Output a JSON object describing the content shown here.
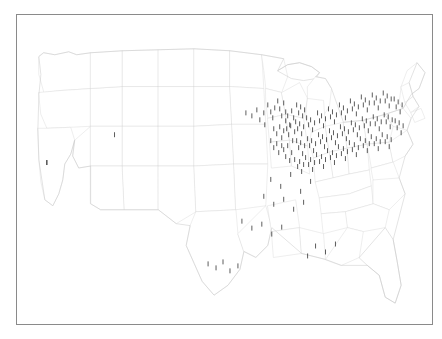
{
  "figure": {
    "type": "point-map",
    "title": "",
    "background_color": "#ffffff",
    "frame": {
      "visible": true,
      "color": "#8a8a8a",
      "x": 16,
      "y": 14,
      "width": 417,
      "height": 311
    },
    "basemap": {
      "region": "United States (contiguous)",
      "boundary_color": "#d9d9d9",
      "coast_color": "#c9c9c9",
      "fill_color": "#ffffff",
      "projection_hint": "albers-usa-like"
    },
    "marker_style": {
      "shape": "vertical-tick",
      "color": "#2a2a2a",
      "width_px": 1,
      "height_px": 5,
      "opacity": 0.85
    },
    "axes": {
      "x_axis_visible": false,
      "y_axis_visible": false,
      "tick_labels": [],
      "gridlines": false
    },
    "legend": {
      "visible": false,
      "entries": []
    },
    "annotations": []
  },
  "chart_data": {
    "type": "scatter",
    "title": "",
    "subtitle": "",
    "xlabel": "",
    "ylabel": "",
    "grid": false,
    "legend_position": "none",
    "xlim": [
      0,
      417
    ],
    "ylim": [
      0,
      311
    ],
    "series": [
      {
        "name": "locations",
        "marker": "vertical-tick",
        "color": "#2a2a2a",
        "count": 184,
        "points": [
          [
            30,
            146
          ],
          [
            30,
            146
          ],
          [
            98,
            118
          ],
          [
            230,
            96
          ],
          [
            236,
            99
          ],
          [
            241,
            93
          ],
          [
            244,
            103
          ],
          [
            248,
            96
          ],
          [
            252,
            88
          ],
          [
            255,
            95
          ],
          [
            257,
            101
          ],
          [
            259,
            91
          ],
          [
            249,
            108
          ],
          [
            262,
            84
          ],
          [
            264,
            92
          ],
          [
            266,
            99
          ],
          [
            268,
            86
          ],
          [
            270,
            95
          ],
          [
            258,
            112
          ],
          [
            261,
            117
          ],
          [
            264,
            110
          ],
          [
            266,
            121
          ],
          [
            268,
            114
          ],
          [
            255,
            124
          ],
          [
            258,
            131
          ],
          [
            261,
            127
          ],
          [
            263,
            136
          ],
          [
            266,
            129
          ],
          [
            270,
            104
          ],
          [
            272,
            99
          ],
          [
            274,
            108
          ],
          [
            276,
            94
          ],
          [
            278,
            101
          ],
          [
            271,
            112
          ],
          [
            273,
            118
          ],
          [
            275,
            109
          ],
          [
            277,
            124
          ],
          [
            279,
            115
          ],
          [
            268,
            133
          ],
          [
            270,
            140
          ],
          [
            272,
            129
          ],
          [
            274,
            144
          ],
          [
            276,
            136
          ],
          [
            281,
            88
          ],
          [
            283,
            96
          ],
          [
            285,
            90
          ],
          [
            287,
            99
          ],
          [
            289,
            93
          ],
          [
            280,
            105
          ],
          [
            282,
            112
          ],
          [
            284,
            107
          ],
          [
            286,
            117
          ],
          [
            288,
            110
          ],
          [
            281,
            124
          ],
          [
            283,
            131
          ],
          [
            285,
            126
          ],
          [
            287,
            137
          ],
          [
            289,
            129
          ],
          [
            279,
            143
          ],
          [
            282,
            150
          ],
          [
            284,
            145
          ],
          [
            286,
            155
          ],
          [
            288,
            148
          ],
          [
            291,
            101
          ],
          [
            293,
            108
          ],
          [
            295,
            103
          ],
          [
            297,
            113
          ],
          [
            299,
            106
          ],
          [
            292,
            122
          ],
          [
            294,
            129
          ],
          [
            296,
            124
          ],
          [
            298,
            134
          ],
          [
            300,
            127
          ],
          [
            290,
            141
          ],
          [
            293,
            148
          ],
          [
            295,
            143
          ],
          [
            297,
            153
          ],
          [
            299,
            146
          ],
          [
            302,
            96
          ],
          [
            304,
            104
          ],
          [
            306,
            99
          ],
          [
            308,
            109
          ],
          [
            310,
            102
          ],
          [
            303,
            118
          ],
          [
            305,
            125
          ],
          [
            307,
            120
          ],
          [
            309,
            130
          ],
          [
            311,
            123
          ],
          [
            301,
            138
          ],
          [
            304,
            145
          ],
          [
            306,
            140
          ],
          [
            308,
            150
          ],
          [
            310,
            143
          ],
          [
            313,
            92
          ],
          [
            315,
            100
          ],
          [
            317,
            95
          ],
          [
            319,
            105
          ],
          [
            321,
            98
          ],
          [
            314,
            114
          ],
          [
            316,
            121
          ],
          [
            318,
            116
          ],
          [
            320,
            126
          ],
          [
            322,
            119
          ],
          [
            312,
            134
          ],
          [
            315,
            141
          ],
          [
            317,
            136
          ],
          [
            319,
            146
          ],
          [
            321,
            139
          ],
          [
            324,
            88
          ],
          [
            326,
            96
          ],
          [
            328,
            91
          ],
          [
            330,
            101
          ],
          [
            332,
            94
          ],
          [
            325,
            110
          ],
          [
            327,
            117
          ],
          [
            329,
            112
          ],
          [
            331,
            122
          ],
          [
            333,
            115
          ],
          [
            323,
            130
          ],
          [
            326,
            137
          ],
          [
            328,
            132
          ],
          [
            330,
            142
          ],
          [
            332,
            135
          ],
          [
            335,
            84
          ],
          [
            337,
            92
          ],
          [
            339,
            87
          ],
          [
            341,
            97
          ],
          [
            343,
            90
          ],
          [
            336,
            106
          ],
          [
            338,
            113
          ],
          [
            340,
            108
          ],
          [
            342,
            118
          ],
          [
            344,
            111
          ],
          [
            334,
            126
          ],
          [
            337,
            133
          ],
          [
            339,
            128
          ],
          [
            341,
            138
          ],
          [
            343,
            131
          ],
          [
            346,
            80
          ],
          [
            348,
            88
          ],
          [
            350,
            83
          ],
          [
            352,
            93
          ],
          [
            354,
            86
          ],
          [
            347,
            102
          ],
          [
            349,
            109
          ],
          [
            351,
            104
          ],
          [
            353,
            114
          ],
          [
            355,
            107
          ],
          [
            345,
            122
          ],
          [
            348,
            129
          ],
          [
            350,
            124
          ],
          [
            352,
            134
          ],
          [
            354,
            127
          ],
          [
            357,
            78
          ],
          [
            359,
            86
          ],
          [
            361,
            81
          ],
          [
            363,
            91
          ],
          [
            365,
            84
          ],
          [
            358,
            100
          ],
          [
            360,
            107
          ],
          [
            362,
            102
          ],
          [
            364,
            112
          ],
          [
            366,
            105
          ],
          [
            356,
            120
          ],
          [
            359,
            127
          ],
          [
            361,
            122
          ],
          [
            363,
            132
          ],
          [
            365,
            125
          ],
          [
            368,
            76
          ],
          [
            370,
            84
          ],
          [
            372,
            79
          ],
          [
            374,
            89
          ],
          [
            376,
            82
          ],
          [
            369,
            98
          ],
          [
            371,
            105
          ],
          [
            373,
            100
          ],
          [
            375,
            110
          ],
          [
            377,
            103
          ],
          [
            367,
            118
          ],
          [
            370,
            125
          ],
          [
            372,
            120
          ],
          [
            374,
            130
          ],
          [
            376,
            123
          ],
          [
            379,
            82
          ],
          [
            381,
            90
          ],
          [
            383,
            85
          ],
          [
            385,
            95
          ],
          [
            387,
            88
          ],
          [
            380,
            104
          ],
          [
            382,
            111
          ],
          [
            384,
            106
          ],
          [
            386,
            116
          ],
          [
            388,
            109
          ],
          [
            255,
            163
          ],
          [
            265,
            170
          ],
          [
            275,
            158
          ],
          [
            285,
            175
          ],
          [
            295,
            165
          ],
          [
            248,
            180
          ],
          [
            258,
            188
          ],
          [
            268,
            183
          ],
          [
            278,
            193
          ],
          [
            288,
            186
          ],
          [
            226,
            205
          ],
          [
            236,
            212
          ],
          [
            246,
            208
          ],
          [
            256,
            218
          ],
          [
            266,
            211
          ],
          [
            192,
            248
          ],
          [
            200,
            252
          ],
          [
            207,
            246
          ],
          [
            214,
            255
          ],
          [
            222,
            250
          ],
          [
            300,
            230
          ],
          [
            310,
            236
          ],
          [
            320,
            228
          ],
          [
            292,
            240
          ]
        ]
      }
    ]
  }
}
